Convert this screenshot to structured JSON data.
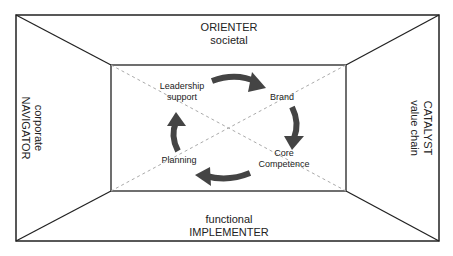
{
  "diagram": {
    "outer_labels": {
      "top": {
        "line1": "ORIENTER",
        "line2": "societal"
      },
      "bottom": {
        "line1": "functional",
        "line2": "IMPLEMENTER"
      },
      "left": {
        "line1": "corporate",
        "line2": "NAVIGATOR"
      },
      "right": {
        "line1": "CATALYST",
        "line2": "value chain"
      }
    },
    "cycle": {
      "nodes": [
        {
          "id": "leadership",
          "line1": "Leadership",
          "line2": "support"
        },
        {
          "id": "brand",
          "line1": "Brand"
        },
        {
          "id": "core",
          "line1": "Core",
          "line2": "Competence"
        },
        {
          "id": "planning",
          "line1": "Planning"
        }
      ],
      "direction": "clockwise"
    },
    "colors": {
      "line": "#222222",
      "arrow": "#444444",
      "dashed": "#aaaaaa"
    }
  }
}
